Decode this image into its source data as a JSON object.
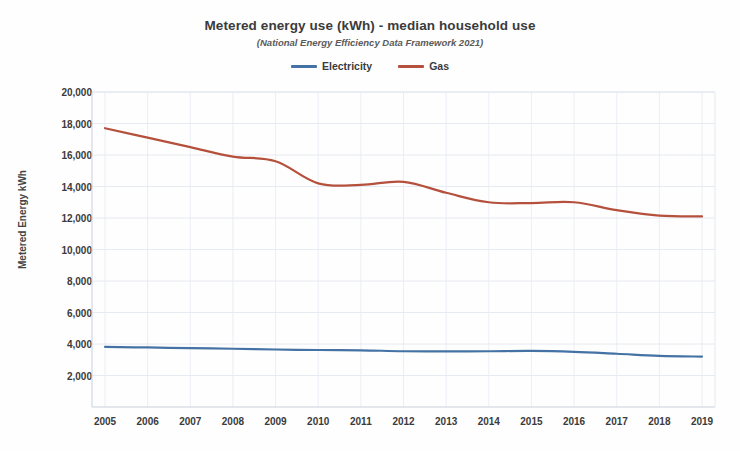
{
  "chart_data": {
    "type": "line",
    "title": "Metered energy use (kWh) - median household use",
    "subtitle": "(National Energy Efficiency Data Framework 2021)",
    "xlabel": "",
    "ylabel": "Metered Energy kWh",
    "categories": [
      2005,
      2006,
      2007,
      2008,
      2009,
      2010,
      2011,
      2012,
      2013,
      2014,
      2015,
      2016,
      2017,
      2018,
      2019
    ],
    "ylim": [
      0,
      20000
    ],
    "ytick_values": [
      2000,
      4000,
      6000,
      8000,
      10000,
      12000,
      14000,
      16000,
      18000,
      20000
    ],
    "ytick_labels": [
      "2,000",
      "4,000",
      "6,000",
      "8,000",
      "10,000",
      "12,000",
      "14,000",
      "16,000",
      "18,000",
      "20,000"
    ],
    "xtick_labels": [
      "2005",
      "2006",
      "2007",
      "2008",
      "2009",
      "2010",
      "2011",
      "2012",
      "2013",
      "2014",
      "2015",
      "2016",
      "2017",
      "2018",
      "2019"
    ],
    "grid": true,
    "legend_position": "top",
    "series": [
      {
        "name": "Electricity",
        "color": "#4472A4",
        "values": [
          3820,
          3780,
          3740,
          3700,
          3650,
          3620,
          3600,
          3540,
          3530,
          3540,
          3560,
          3500,
          3380,
          3250,
          3200
        ]
      },
      {
        "name": "Gas",
        "color": "#B5503C",
        "values": [
          17700,
          17100,
          16500,
          15900,
          15600,
          14200,
          14100,
          14300,
          13600,
          13000,
          12950,
          13000,
          12500,
          12150,
          12100
        ]
      }
    ]
  },
  "legend": {
    "items": [
      {
        "label": "Electricity",
        "color": "#4472A4"
      },
      {
        "label": "Gas",
        "color": "#B5503C"
      }
    ]
  },
  "axes": {
    "y_title": "Metered Energy kWh"
  }
}
